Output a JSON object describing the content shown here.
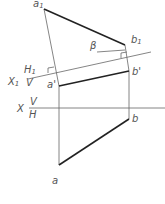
{
  "diagram": {
    "type": "descriptive-geometry-auxiliary-projection",
    "labels": {
      "a1": "a",
      "a1_sub": "1",
      "b1": "b",
      "b1_sub": "1",
      "beta": "β",
      "H1": "H",
      "H1_sub": "1",
      "X1": "X",
      "X1_sub": "1",
      "V1": "V",
      "a_prime": "a'",
      "b_prime": "b'",
      "X": "X",
      "V": "V",
      "H": "H",
      "a": "a",
      "b": "b"
    },
    "colors": {
      "thick_line": "#222222",
      "thin_line": "#666666",
      "label": "#555555"
    }
  }
}
